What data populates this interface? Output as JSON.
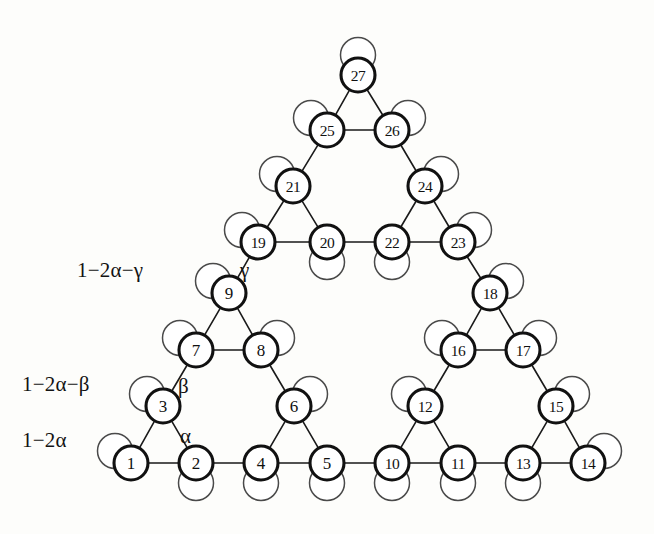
{
  "figure": {
    "kind": "sierpinski-gasket-graph",
    "level": 3,
    "node_count": 27,
    "background_color": "#fdfdfb",
    "node_stroke_color": "#111111",
    "loop_stroke_color": "#4a4a4a",
    "edge_color": "#1a1a1a"
  },
  "nodes": [
    {
      "id": "1",
      "label": "1",
      "x": 131,
      "y": 463,
      "loop": "up-left"
    },
    {
      "id": "2",
      "label": "2",
      "x": 196,
      "y": 463,
      "loop": "down"
    },
    {
      "id": "3",
      "label": "3",
      "x": 163,
      "y": 406,
      "loop": "up-left"
    },
    {
      "id": "4",
      "label": "4",
      "x": 261,
      "y": 463,
      "loop": "down"
    },
    {
      "id": "5",
      "label": "5",
      "x": 327,
      "y": 463,
      "loop": "down"
    },
    {
      "id": "6",
      "label": "6",
      "x": 294,
      "y": 406,
      "loop": "up-right"
    },
    {
      "id": "7",
      "label": "7",
      "x": 196,
      "y": 350,
      "loop": "up-left"
    },
    {
      "id": "8",
      "label": "8",
      "x": 261,
      "y": 350,
      "loop": "up-right"
    },
    {
      "id": "9",
      "label": "9",
      "x": 229,
      "y": 293,
      "loop": "up-left"
    },
    {
      "id": "10",
      "label": "10",
      "x": 392,
      "y": 463,
      "loop": "down"
    },
    {
      "id": "11",
      "label": "11",
      "x": 458,
      "y": 463,
      "loop": "down"
    },
    {
      "id": "12",
      "label": "12",
      "x": 425,
      "y": 406,
      "loop": "up-left"
    },
    {
      "id": "13",
      "label": "13",
      "x": 523,
      "y": 463,
      "loop": "down"
    },
    {
      "id": "14",
      "label": "14",
      "x": 588,
      "y": 463,
      "loop": "up-right"
    },
    {
      "id": "15",
      "label": "15",
      "x": 556,
      "y": 406,
      "loop": "up-right"
    },
    {
      "id": "16",
      "label": "16",
      "x": 458,
      "y": 350,
      "loop": "up-left"
    },
    {
      "id": "17",
      "label": "17",
      "x": 523,
      "y": 350,
      "loop": "up-right"
    },
    {
      "id": "18",
      "label": "18",
      "x": 490,
      "y": 293,
      "loop": "up-right"
    },
    {
      "id": "19",
      "label": "19",
      "x": 258,
      "y": 242,
      "loop": "up-left"
    },
    {
      "id": "20",
      "label": "20",
      "x": 327,
      "y": 242,
      "loop": "down"
    },
    {
      "id": "21",
      "label": "21",
      "x": 293,
      "y": 186,
      "loop": "up-left"
    },
    {
      "id": "22",
      "label": "22",
      "x": 392,
      "y": 242,
      "loop": "down"
    },
    {
      "id": "23",
      "label": "23",
      "x": 458,
      "y": 242,
      "loop": "up-right"
    },
    {
      "id": "24",
      "label": "24",
      "x": 425,
      "y": 186,
      "loop": "up-right"
    },
    {
      "id": "25",
      "label": "25",
      "x": 327,
      "y": 130,
      "loop": "up-left"
    },
    {
      "id": "26",
      "label": "26",
      "x": 392,
      "y": 130,
      "loop": "up-right"
    },
    {
      "id": "27",
      "label": "27",
      "x": 358,
      "y": 75,
      "loop": "up"
    }
  ],
  "edges": [
    [
      "1",
      "2"
    ],
    [
      "1",
      "3"
    ],
    [
      "2",
      "3"
    ],
    [
      "2",
      "4"
    ],
    [
      "4",
      "5"
    ],
    [
      "4",
      "6"
    ],
    [
      "5",
      "6"
    ],
    [
      "3",
      "7"
    ],
    [
      "5",
      "10"
    ],
    [
      "7",
      "8"
    ],
    [
      "7",
      "9"
    ],
    [
      "8",
      "9"
    ],
    [
      "6",
      "8"
    ],
    [
      "10",
      "11"
    ],
    [
      "10",
      "12"
    ],
    [
      "11",
      "12"
    ],
    [
      "11",
      "13"
    ],
    [
      "13",
      "14"
    ],
    [
      "13",
      "15"
    ],
    [
      "14",
      "15"
    ],
    [
      "12",
      "16"
    ],
    [
      "15",
      "17"
    ],
    [
      "16",
      "17"
    ],
    [
      "16",
      "18"
    ],
    [
      "17",
      "18"
    ],
    [
      "9",
      "19"
    ],
    [
      "18",
      "23"
    ],
    [
      "19",
      "20"
    ],
    [
      "19",
      "21"
    ],
    [
      "20",
      "21"
    ],
    [
      "20",
      "22"
    ],
    [
      "22",
      "23"
    ],
    [
      "22",
      "24"
    ],
    [
      "23",
      "24"
    ],
    [
      "21",
      "25"
    ],
    [
      "24",
      "26"
    ],
    [
      "25",
      "26"
    ],
    [
      "25",
      "27"
    ],
    [
      "26",
      "27"
    ]
  ],
  "labels": {
    "side": [
      {
        "id": "gamma-row",
        "text": "1−2α−γ",
        "x": 77,
        "y": 258
      },
      {
        "id": "beta-row",
        "text": "1−2α−β",
        "x": 22,
        "y": 372
      },
      {
        "id": "alpha-row",
        "text": "1−2α",
        "x": 22,
        "y": 428
      }
    ],
    "greek": [
      {
        "id": "gamma-edge",
        "text": "γ",
        "x": 240,
        "y": 258
      },
      {
        "id": "beta-edge",
        "text": "β",
        "x": 178,
        "y": 374
      },
      {
        "id": "alpha-edge",
        "text": "α",
        "x": 180,
        "y": 424
      }
    ]
  },
  "geometry": {
    "node_radius": 17,
    "loop_radius": 17.5,
    "loop_offset": 20
  }
}
